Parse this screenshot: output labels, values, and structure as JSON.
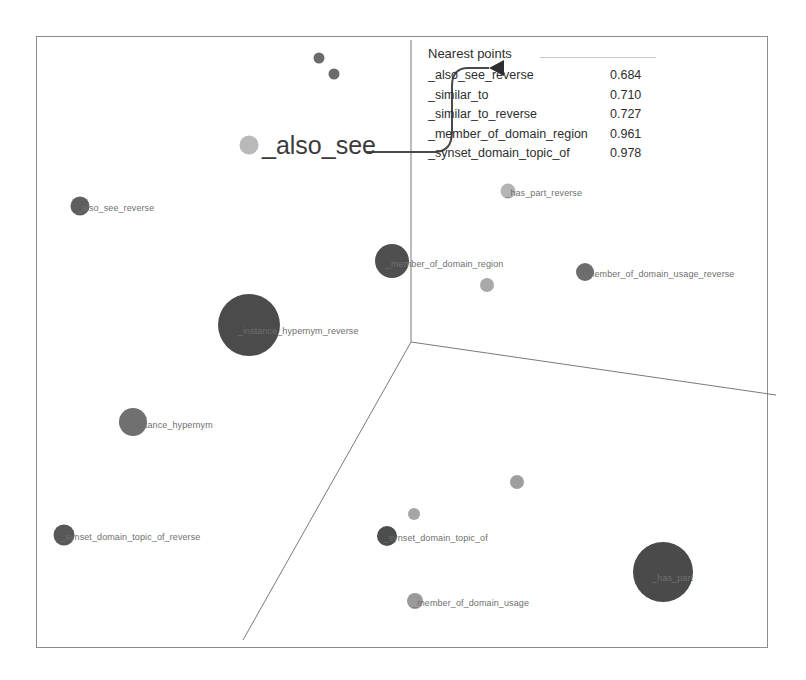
{
  "panel": {
    "title": "Nearest points",
    "rows": [
      {
        "name": "_also_see_reverse",
        "value": "0.684"
      },
      {
        "name": "_similar_to",
        "value": "0.710"
      },
      {
        "name": "_similar_to_reverse",
        "value": "0.727"
      },
      {
        "name": "_member_of_domain_region",
        "value": "0.961"
      },
      {
        "name": "_synset_domain_topic_of",
        "value": "0.978"
      }
    ]
  },
  "selected": {
    "label": "_also_see"
  },
  "chart_data": {
    "type": "scatter",
    "title": "",
    "xlabel": "",
    "ylabel": "",
    "grid": false,
    "legend_position": "none",
    "projection": "3d",
    "axis_origin": {
      "x": 411,
      "y": 342
    },
    "axis_endpoints": [
      {
        "name": "vertical-axis",
        "x": 411,
        "y": 40
      },
      {
        "name": "right-axis",
        "x": 776,
        "y": 395
      },
      {
        "name": "left-axis",
        "x": 243,
        "y": 640
      }
    ],
    "points": [
      {
        "label": "",
        "x": 319,
        "y": 58,
        "size": 11,
        "color": "#6b6b6b"
      },
      {
        "label": "",
        "x": 334,
        "y": 74,
        "size": 11,
        "color": "#6b6b6b"
      },
      {
        "label": "_also_see",
        "x": 249,
        "y": 145,
        "size": 19,
        "color": "#b9b9b9",
        "highlighted": true
      },
      {
        "label": "_also_see_reverse",
        "x": 80,
        "y": 206,
        "size": 19,
        "color": "#5e5e5e"
      },
      {
        "label": "_has_part_reverse",
        "x": 508,
        "y": 191,
        "size": 15,
        "color": "#b5b5b5"
      },
      {
        "label": "_member_of_domain_region",
        "x": 392,
        "y": 261,
        "size": 34,
        "color": "#4f4f4f"
      },
      {
        "label": "",
        "x": 487,
        "y": 285,
        "size": 14,
        "color": "#a9a9a9"
      },
      {
        "label": "_member_of_domain_usage_reverse",
        "x": 585,
        "y": 272,
        "size": 18,
        "color": "#6d6d6d"
      },
      {
        "label": "_instance_hypernym_reverse",
        "x": 249,
        "y": 325,
        "size": 62,
        "color": "#4b4b4b"
      },
      {
        "label": "_instance_hypernym",
        "x": 133,
        "y": 422,
        "size": 28,
        "color": "#707070"
      },
      {
        "label": "_synset_domain_topic_of_reverse",
        "x": 64,
        "y": 535,
        "size": 21,
        "color": "#585858"
      },
      {
        "label": "",
        "x": 517,
        "y": 482,
        "size": 14,
        "color": "#9e9e9e"
      },
      {
        "label": "",
        "x": 414,
        "y": 514,
        "size": 12,
        "color": "#a5a5a5"
      },
      {
        "label": "_synset_domain_topic_of",
        "x": 387,
        "y": 536,
        "size": 20,
        "color": "#4d4d4d"
      },
      {
        "label": "_member_of_domain_usage",
        "x": 415,
        "y": 601,
        "size": 16,
        "color": "#9a9a9a"
      },
      {
        "label": "_has_part",
        "x": 663,
        "y": 572,
        "size": 60,
        "color": "#4a4a4a"
      }
    ]
  },
  "colors": {
    "frame": "#8d8d8d",
    "axis": "#7a7a7a",
    "label": "#6f6f6f",
    "text": "#2e2e2e",
    "callout": "#4a4a4a"
  }
}
